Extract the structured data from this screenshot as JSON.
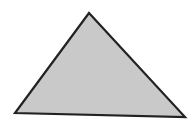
{
  "figure": {
    "shape": "triangle",
    "vertices": [
      [
        89,
        13
      ],
      [
        15,
        113
      ],
      [
        185,
        117
      ]
    ],
    "fill": "#c9c9c9",
    "stroke": "#222222",
    "stroke_width": 2.2,
    "background": "#ffffff"
  }
}
